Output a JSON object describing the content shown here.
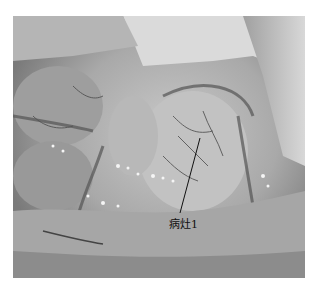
{
  "figure": {
    "type": "grayscale intraoperative photograph",
    "annotation": {
      "label": "病灶1",
      "pointer": "leader line to lesion"
    }
  }
}
